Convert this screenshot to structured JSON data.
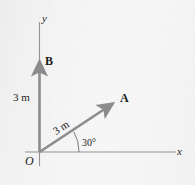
{
  "figure": {
    "kind": "vector-diagram",
    "axes": {
      "x_label": "x",
      "y_label": "y",
      "origin_label": "O"
    },
    "vectors": [
      {
        "name": "A",
        "label": "A",
        "magnitude_label": "3 m",
        "angle_label": "30°",
        "angle_degrees": 30,
        "direction": "30 degrees above the positive x-axis",
        "color": "#8c8c8c"
      },
      {
        "name": "B",
        "label": "B",
        "magnitude_label": "3 m",
        "angle_degrees": 90,
        "direction": "along the positive y-axis",
        "color": "#8c8c8c"
      }
    ],
    "colors": {
      "background": "#f3f3f3",
      "axis": "#8f8f8f",
      "vector": "#8c8c8c",
      "text": "#1b1b1b"
    }
  }
}
